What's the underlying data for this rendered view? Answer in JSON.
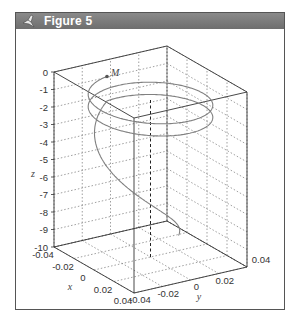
{
  "window": {
    "title": "Figure 5",
    "icon": "matlab-figure-icon",
    "titlebar_color": "#777777"
  },
  "chart_data": {
    "type": "line3d",
    "title": "",
    "xlabel": "x",
    "ylabel": "y",
    "zlabel": "z",
    "xlim": [
      -0.04,
      0.04
    ],
    "ylim": [
      -0.04,
      0.04
    ],
    "zlim": [
      -10,
      0
    ],
    "x_ticks": [
      "-0.04",
      "-0.02",
      "0",
      "0.02",
      "0.04"
    ],
    "y_ticks": [
      "-0.04",
      "-0.02",
      "0",
      "0.02",
      "0.04"
    ],
    "z_ticks": [
      "0",
      "-1",
      "-2",
      "-3",
      "-4",
      "-5",
      "-6",
      "-7",
      "-8",
      "-9",
      "-10"
    ],
    "grid": true,
    "box": true,
    "curve_color": "#808080",
    "annotation": {
      "label": "M",
      "note": "marked point near start of spiral",
      "x": -0.03,
      "y": -0.01,
      "z": -0.9
    },
    "series": [
      {
        "name": "trajectory",
        "points_note": "parametric spiral, see curve generator"
      }
    ]
  }
}
